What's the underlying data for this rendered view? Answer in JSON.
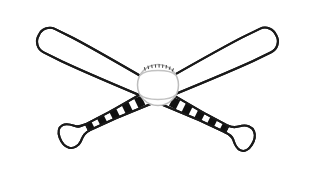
{
  "artwork": {
    "title": "Crossed Baseball Bats with Baseball",
    "subject": "baseball-bats-crossed",
    "style": "black-and-white line art",
    "canvas": {
      "width": 315,
      "height": 182,
      "background_color": "#ffffff"
    },
    "colors": {
      "outline": "#1a1a1a",
      "fill": "#ffffff",
      "grip_tape": "#111111",
      "ball_outline": "#b8b8b8",
      "ball_seam": "#c2c2c2",
      "ball_fill": "#ffffff"
    },
    "elements": [
      {
        "id": "bat-left",
        "label": "Left Baseball Bat",
        "description": "Bat with rounded barrel at upper-left tapering to knobbed handle at lower-right",
        "barrel_end": "top-left",
        "knob_end": "bottom-right",
        "grip_stripe_count": 7
      },
      {
        "id": "bat-right",
        "label": "Right Baseball Bat",
        "description": "Bat with rounded barrel at upper-right tapering to knobbed handle at lower-left",
        "barrel_end": "top-right",
        "knob_end": "bottom-left",
        "grip_stripe_count": 7
      },
      {
        "id": "baseball",
        "label": "Baseball",
        "description": "Ball at the crossing point of the two bats with two curved stitched seams",
        "center_x": 158,
        "center_y": 85,
        "radius": 20,
        "seam_count": 2,
        "stitch_count": 13
      }
    ]
  }
}
